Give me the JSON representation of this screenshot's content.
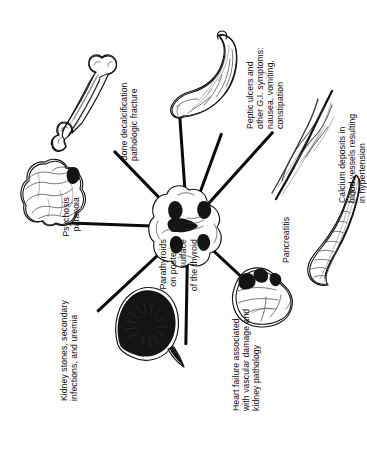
{
  "diagram": {
    "type": "radial-spoke",
    "title_center": "Parathyroids\non posterior surface\nof the thyroid",
    "center_illustration": "parathyroid-glands-on-thyroid",
    "orientation_note": "rotated",
    "spokes": [
      {
        "id": "kidney",
        "label": "Kidney stones, secondary\ninfections, and uremia",
        "illustration": "kidney-sectioned"
      },
      {
        "id": "heart",
        "label": "Heart failure associated\nwith vascular damage and\nkidney pathology",
        "illustration": "heart"
      },
      {
        "id": "pancreas",
        "label": "Pancreatitis",
        "illustration": "pancreas"
      },
      {
        "id": "vessels",
        "label": "Calcium deposits in\nblood vessels resulting\nin hypertension",
        "illustration": "blood-vessels"
      },
      {
        "id": "stomach",
        "label": "Peptic ulcers and\nother G.I. symptoms:\nnausea, vomiting,\nconstipation",
        "illustration": "stomach"
      },
      {
        "id": "bone",
        "label": "Bone decalcification\npathologic fracture",
        "illustration": "long-bone"
      },
      {
        "id": "brain",
        "label": "Psychosis\nparanoia",
        "illustration": "brain"
      }
    ],
    "colors": {
      "ink": "#111111",
      "background": "#ffffff",
      "text": "#0d0d0d"
    }
  }
}
